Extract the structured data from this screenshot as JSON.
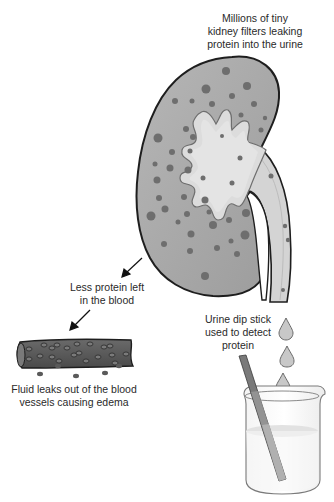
{
  "diagram": {
    "type": "medical-illustration",
    "labels": {
      "kidney_filters": {
        "lines": [
          "Millions of tiny",
          "kidney filters leaking",
          "protein into the urine"
        ]
      },
      "less_protein": {
        "lines": [
          "Less protein left",
          "in the blood"
        ]
      },
      "fluid_leaks": {
        "lines": [
          "Fluid leaks out of the blood",
          "vessels causing edema"
        ]
      },
      "dip_stick": {
        "lines": [
          "Urine dip stick",
          "used to detect",
          "protein"
        ]
      }
    },
    "elements": [
      {
        "name": "kidney",
        "icon": "kidney-icon"
      },
      {
        "name": "ureter",
        "icon": "ureter-icon"
      },
      {
        "name": "blood-vessel",
        "icon": "blood-vessel-icon"
      },
      {
        "name": "beaker",
        "icon": "beaker-icon"
      },
      {
        "name": "dip-stick",
        "icon": "dip-stick-icon"
      },
      {
        "name": "urine-drops",
        "count": 3
      },
      {
        "name": "arrows",
        "count": 2
      }
    ],
    "colors": {
      "kidney_fill": "#a8a8a8",
      "kidney_outline": "#1e1e1e",
      "pelvis_fill": "#d6d6d6",
      "spot": "#6e6e6e",
      "vessel_fill": "#5a5a5a",
      "stick": "#7a7a7a",
      "beaker_fluid": "#f0f0f0"
    }
  }
}
